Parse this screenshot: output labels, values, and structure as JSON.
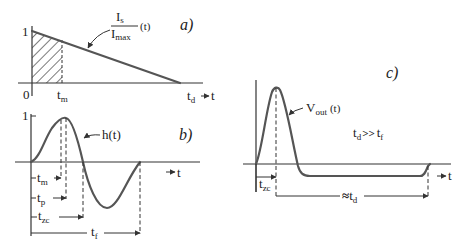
{
  "panels": {
    "a": {
      "label": "a)",
      "y_tick": "1",
      "origin_label": "0",
      "tm_label": "t",
      "tm_sub": "m",
      "td_label": "t",
      "td_sub": "d",
      "t_axis_label": "t",
      "curve_num": "I",
      "curve_num_sub": "s",
      "curve_den": "I",
      "curve_den_sub": "max",
      "curve_arg": "(t)"
    },
    "b": {
      "label": "b)",
      "y_tick": "1",
      "curve_label": "h(t)",
      "t_axis_label": "t",
      "tm_label": "t",
      "tm_sub": "m",
      "tp_label": "t",
      "tp_sub": "p",
      "tzc_label": "t",
      "tzc_sub": "zc",
      "tf_label": "t",
      "tf_sub": "f"
    },
    "c": {
      "label": "c)",
      "curve_label": "V",
      "curve_sub": "out",
      "curve_arg": "(t)",
      "relation_t1": "t",
      "relation_t1_sub": "d",
      "relation_op": ">>",
      "relation_t2": "t",
      "relation_t2_sub": "f",
      "t_axis_label": "t",
      "tzc_label": "t",
      "tzc_sub": "zc",
      "td_prefix": "≈",
      "td_label": "t",
      "td_sub": "d"
    }
  },
  "colors": {
    "curve": "#555555",
    "axis": "#333333",
    "background": "#ffffff"
  }
}
